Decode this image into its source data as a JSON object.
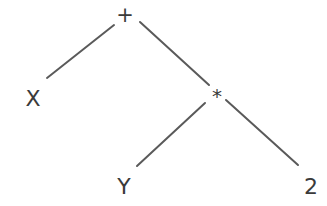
{
  "diagram": {
    "type": "expression-tree",
    "colors": {
      "background": "#ffffff",
      "edge": "#5a5a5a",
      "text": "#3a3a3a"
    },
    "nodes": [
      {
        "id": "plus",
        "label": "+",
        "x": 125,
        "y": 15,
        "size": 21
      },
      {
        "id": "x",
        "label": "X",
        "x": 33,
        "y": 98,
        "size": 22
      },
      {
        "id": "times",
        "label": "*",
        "x": 217,
        "y": 96,
        "size": 20
      },
      {
        "id": "y",
        "label": "Y",
        "x": 124,
        "y": 186,
        "size": 22
      },
      {
        "id": "two",
        "label": "2",
        "x": 311,
        "y": 186,
        "size": 22
      }
    ],
    "edges": [
      {
        "from": "plus",
        "to": "x",
        "x1": 114,
        "y1": 25,
        "x2": 47,
        "y2": 78
      },
      {
        "from": "plus",
        "to": "times",
        "x1": 140,
        "y1": 22,
        "x2": 209,
        "y2": 85
      },
      {
        "from": "times",
        "to": "y",
        "x1": 205,
        "y1": 103,
        "x2": 137,
        "y2": 166
      },
      {
        "from": "times",
        "to": "two",
        "x1": 226,
        "y1": 100,
        "x2": 298,
        "y2": 165
      }
    ]
  }
}
